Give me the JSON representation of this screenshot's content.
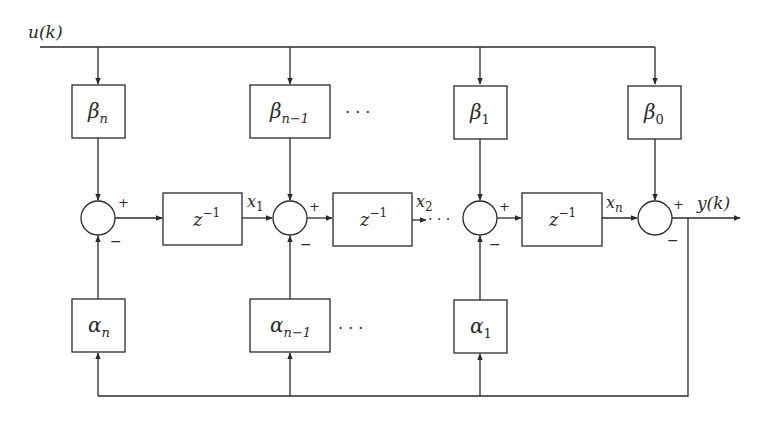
{
  "diagram": {
    "input_label": {
      "base": "u",
      "arg": "(k)"
    },
    "output_label": {
      "base": "y",
      "arg": "(k)"
    },
    "beta_blocks": [
      {
        "symbol": "β",
        "sub": "n"
      },
      {
        "symbol": "β",
        "sub": "n−1"
      },
      {
        "symbol": "β",
        "sub": "1"
      },
      {
        "symbol": "β",
        "sub": "0"
      }
    ],
    "alpha_blocks": [
      {
        "symbol": "α",
        "sub": "n"
      },
      {
        "symbol": "α",
        "sub": "n−1"
      },
      {
        "symbol": "α",
        "sub": "1"
      }
    ],
    "delay_blocks": [
      {
        "base": "z",
        "exp": "−1"
      },
      {
        "base": "z",
        "exp": "−1"
      },
      {
        "base": "z",
        "exp": "−1"
      }
    ],
    "state_labels": [
      {
        "base": "x",
        "sub": "1"
      },
      {
        "base": "x",
        "sub": "2"
      },
      {
        "base": "x",
        "sub": "n"
      }
    ],
    "signs": {
      "plus": "+",
      "minus": "−"
    },
    "ellipsis": "· · ·",
    "colors": {
      "stroke": "#2a2a2a",
      "background": "#ffffff"
    }
  }
}
